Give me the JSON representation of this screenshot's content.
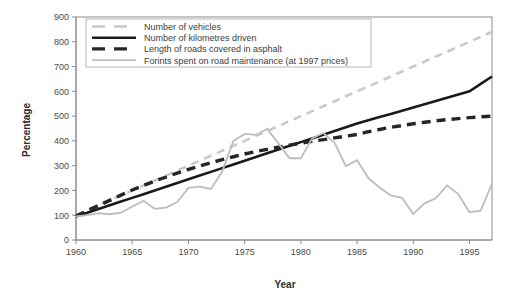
{
  "chart_data": {
    "type": "line",
    "title": "",
    "xlabel": "Year",
    "ylabel": "Percentage",
    "xlim": [
      1960,
      1997
    ],
    "ylim": [
      0,
      900
    ],
    "grid": false,
    "legend_position": "top-left",
    "xticks": [
      1960,
      1965,
      1970,
      1975,
      1980,
      1985,
      1990,
      1995
    ],
    "yticks": [
      0,
      100,
      200,
      300,
      400,
      500,
      600,
      700,
      800,
      900
    ],
    "x": [
      1960,
      1961,
      1962,
      1963,
      1964,
      1965,
      1966,
      1967,
      1968,
      1969,
      1970,
      1971,
      1972,
      1973,
      1974,
      1975,
      1976,
      1977,
      1978,
      1979,
      1980,
      1981,
      1982,
      1983,
      1984,
      1985,
      1986,
      1987,
      1988,
      1989,
      1990,
      1991,
      1992,
      1993,
      1994,
      1995,
      1996,
      1997
    ],
    "series": [
      {
        "name": "Number of vehicles",
        "color": "#c9c9c9",
        "style": "dashed",
        "width": 2.6,
        "values": [
          100,
          120,
          140,
          160,
          180,
          200,
          220,
          240,
          260,
          280,
          300,
          320,
          340,
          360,
          380,
          400,
          420,
          440,
          460,
          480,
          500,
          520,
          540,
          560,
          580,
          600,
          620,
          640,
          660,
          680,
          700,
          720,
          740,
          760,
          780,
          800,
          820,
          840
        ]
      },
      {
        "name": "Number of kilometres driven",
        "color": "#1a1a1a",
        "style": "solid",
        "width": 2.6,
        "values": [
          95,
          110,
          125,
          140,
          155,
          170,
          185,
          200,
          215,
          230,
          245,
          260,
          275,
          290,
          305,
          320,
          335,
          350,
          365,
          380,
          395,
          410,
          425,
          440,
          455,
          470,
          483,
          496,
          509,
          522,
          535,
          548,
          561,
          574,
          587,
          600,
          630,
          660
        ]
      },
      {
        "name": "Length of roads covered in asphalt",
        "color": "#262626",
        "style": "dashed",
        "width": 3.4,
        "values": [
          97,
          118,
          139,
          160,
          181,
          202,
          220,
          238,
          254,
          270,
          285,
          299,
          312,
          324,
          336,
          347,
          357,
          366,
          375,
          383,
          391,
          398,
          405,
          412,
          419,
          426,
          437,
          446,
          455,
          462,
          469,
          475,
          481,
          486,
          490,
          494,
          497,
          500
        ]
      },
      {
        "name": "Forints spent on road maintenance (at 1997 prices)",
        "color": "#bdbdbd",
        "style": "solid",
        "width": 1.8,
        "values": [
          95,
          100,
          108,
          104,
          110,
          135,
          158,
          126,
          131,
          153,
          210,
          215,
          206,
          275,
          400,
          428,
          424,
          448,
          390,
          330,
          330,
          410,
          432,
          392,
          298,
          322,
          250,
          212,
          180,
          170,
          105,
          148,
          168,
          220,
          185,
          112,
          118,
          228
        ]
      }
    ]
  },
  "legend": {
    "entries": [
      {
        "label": "Number of vehicles"
      },
      {
        "label": "Number of kilometres driven"
      },
      {
        "label": "Length of roads covered in asphalt"
      },
      {
        "label": "Forints spent on road maintenance (at 1997 prices)"
      }
    ]
  },
  "axes": {
    "y_title": "Percentage",
    "x_title": "Year"
  }
}
